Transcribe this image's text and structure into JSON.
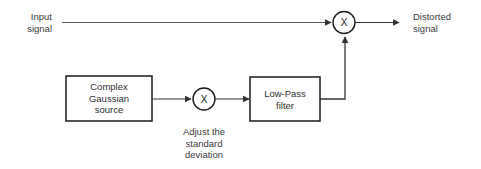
{
  "diagram": {
    "type": "block-diagram",
    "background_color": "#ffffff",
    "line_color": "#333333",
    "text_color": "#3b3b3b",
    "labels": {
      "input_signal": "Input\nsignal",
      "distorted_signal": "Distorted\nsignal",
      "adjust_caption": "Adjust the\nstandard\ndeviation"
    },
    "blocks": {
      "gaussian_source": "Complex\nGaussian\nsource",
      "low_pass_filter": "Low-Pass\nfilter"
    },
    "operators": {
      "top_multiplier": "X",
      "mid_multiplier": "X"
    }
  }
}
